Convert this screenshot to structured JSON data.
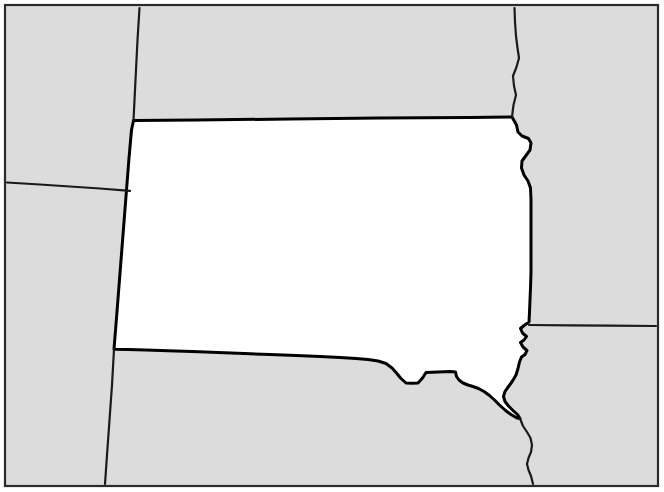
{
  "map": {
    "title": "South Dakota state outline map",
    "width": 664,
    "height": 492,
    "colors": {
      "highlight_fill": "#ffffff",
      "surrounding_fill": "#dcdcdc",
      "state_outline": "#000000",
      "internal_border": "#1a1a1a",
      "frame": "#2b2b2b",
      "page_background": "#ffffff"
    },
    "frame": {
      "x": 5,
      "y": 5,
      "width": 653,
      "height": 481,
      "stroke_width": 2.2
    },
    "highlighted_state": {
      "name": "South Dakota",
      "fill": "#ffffff",
      "stroke_width": 3.0,
      "path": "M 133.5,120.5 L 196,120.0 L 290,119.0 L 380,118.0 L 470,117.4 L 512,117.0 L 516.5,125.0 L 518.0,132.0 L 522.0,136.0 L 528.5,138.5 L 531.0,143.0 L 530.0,150.0 L 526.0,155.5 L 522.0,161.0 L 521.5,168.0 L 524.0,175.0 L 528.0,181.0 L 530.5,188.0 L 531.0,200.0 L 531.0,225.0 L 531.0,250.0 L 531.0,272.0 L 530.5,288.0 L 530.0,300.0 L 529.5,312.0 L 529.0,322.0 L 524.0,325.5 L 520.5,328.5 L 522.5,333.0 L 526.5,336.5 L 524.0,340.0 L 520.5,342.5 L 523.0,347.0 L 527.0,350.5 L 525.0,354.5 L 521.5,357.0 L 519.5,362.0 L 518.0,368.5 L 516.0,375.0 L 512.5,381.0 L 508.5,386.5 L 505.0,391.5 L 503.5,396.5 L 505.0,401.5 L 508.5,406.0 L 513.0,410.5 L 517.5,414.5 L 520.0,418.5 L 517.0,418.0 L 511.0,414.5 L 505.0,410.0 L 499.5,405.0 L 494.5,400.0 L 489.5,395.5 L 484.0,391.5 L 478.5,388.5 L 473.0,386.5 L 468.0,385.0 L 463.0,383.0 L 459.0,380.0 L 456.5,376.5 L 455.5,372.0 L 450.0,371.5 L 444.0,371.8 L 438.0,372.0 L 432.0,372.2 L 426.0,372.5 L 422.5,378.0 L 418.0,383.0 L 412.0,383.2 L 406.0,383.0 L 400.5,378.0 L 396.5,373.0 L 392.0,368.0 L 386.0,363.5 L 378.0,361.0 L 368.0,359.5 L 356.0,358.5 L 340.0,357.5 L 320.0,356.5 L 296.0,355.5 L 270.0,354.5 L 244.0,353.5 L 218.0,352.5 L 192.0,351.5 L 168.0,350.8 L 146.0,350.0 L 128.0,349.5 L 114.0,349.2 L 116.5,318.0 L 119.0,286.0 L 121.5,254.0 L 124.0,222.0 L 126.5,190.0 L 129.0,158.0 L 131.5,130.0 Z"
    },
    "neighbors": [
      {
        "name": "North Dakota",
        "label_shown": false
      },
      {
        "name": "Montana",
        "label_shown": false
      },
      {
        "name": "Wyoming",
        "label_shown": false
      },
      {
        "name": "Nebraska",
        "label_shown": false
      },
      {
        "name": "Minnesota",
        "label_shown": false
      },
      {
        "name": "Iowa",
        "label_shown": false
      }
    ],
    "internal_borders": [
      {
        "name": "montana-north-dakota-border",
        "description": "vertical line north of South Dakota's northwest corner",
        "path": "M 139.5,8.0 L 137.5,40.0 L 136.0,70.0 L 134.5,100.0 L 133.5,120.5",
        "stroke_width": 2.2
      },
      {
        "name": "montana-wyoming-border",
        "description": "near-horizontal line west of South Dakota",
        "path": "M 7.0,182.5 L 40.0,184.5 L 70.0,186.5 L 100.0,188.5 L 130.0,190.8",
        "stroke_width": 2.2
      },
      {
        "name": "wyoming-nebraska-border",
        "description": "vertical line continuing south from South Dakota's southwest corner",
        "path": "M 114.0,349.2 L 112.0,385.0 L 109.5,420.0 L 107.0,455.0 L 105.0,484.0",
        "stroke_width": 2.2
      },
      {
        "name": "north-dakota-minnesota-border",
        "description": "Red River boundary north of South Dakota's northeast corner",
        "path": "M 512.0,117.0 L 513.5,105.0 L 516.0,95.0 L 514.0,86.0 L 513.0,76.0 L 516.5,67.0 L 519.0,58.0 L 517.5,48.0 L 516.0,36.0 L 515.0,22.0 L 514.5,8.0",
        "stroke_width": 2.2
      },
      {
        "name": "minnesota-iowa-border",
        "description": "horizontal line east of South Dakota",
        "path": "M 529.0,325.0 L 570.0,325.3 L 610.0,325.6 L 656.0,326.0",
        "stroke_width": 2.2
      },
      {
        "name": "nebraska-iowa-border",
        "description": "Missouri River boundary south of South Dakota's southeast corner",
        "path": "M 520.0,418.5 L 523.0,426.0 L 527.0,432.0 L 530.5,438.0 L 532.0,445.0 L 531.0,452.0 L 528.5,458.0 L 527.0,464.0 L 528.5,470.0 L 531.0,476.0 L 533.0,484.0",
        "stroke_width": 2.2
      }
    ]
  }
}
